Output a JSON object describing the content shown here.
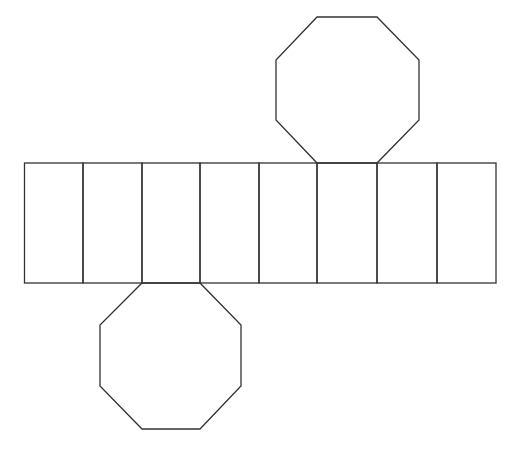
{
  "diagram": {
    "title": "Net of an octagonal prism",
    "description": "Eight congruent rectangular lateral faces in a row, with one regular octagon base attached above the sixth rectangle and one attached below the third rectangle.",
    "stroke_color": "#333333",
    "background_color": "#ffffff",
    "lateral_faces": {
      "count": 8,
      "top_y": 163,
      "bottom_y": 283,
      "edges_x": [
        24.5,
        83,
        142,
        200,
        259,
        317,
        377,
        437,
        496
      ]
    },
    "bases": [
      {
        "name": "top-octagon",
        "attached_to_face_index": 5,
        "points": "317,163 377,163 419,120 419,60 377,17 317,17 276,60 276,120"
      },
      {
        "name": "bottom-octagon",
        "attached_to_face_index": 2,
        "points": "142,283 200,283 241,325 241,386 200,429 142,429 100,386 100,325"
      }
    ]
  }
}
